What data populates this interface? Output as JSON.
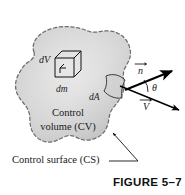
{
  "figure": {
    "caption": "FIGURE 5–7",
    "domain": "textbook-figure",
    "background_color": "#ffffff",
    "blob": {
      "name": "control-volume-blob",
      "fill_color": "#d6d6d6",
      "fill_color_light": "#eceaea",
      "edge_color": "#6b6b6b",
      "edge_style": "dashed"
    },
    "labels": {
      "dV": "dV",
      "dm": "dm",
      "dA": "dA",
      "theta": "θ",
      "n_vector": "n",
      "V_vector": "V",
      "control_volume_line1": "Control",
      "control_volume_line2": "volume (CV)",
      "control_surface": "Control surface (CS)"
    },
    "icons": {
      "cube": "differential-volume-cube-icon",
      "patch": "differential-area-patch-icon",
      "normal_arrow": "normal-vector-arrow-icon",
      "velocity_arrow": "velocity-vector-arrow-icon",
      "angle_arc": "angle-arc-icon",
      "leader": "leader-line-icon"
    },
    "colors": {
      "ink": "#1a1a1a",
      "arrow": "#000000",
      "caption": "#111111"
    }
  }
}
